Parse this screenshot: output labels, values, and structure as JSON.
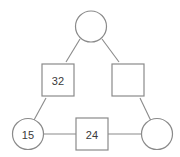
{
  "diagram": {
    "type": "pedigree-chart",
    "background_color": "#ffffff",
    "stroke_color": "#8a8a8a",
    "label_color": "#3a3a3a",
    "nodes": [
      {
        "id": "top-circle",
        "shape": "circle",
        "label": "",
        "cx": 91,
        "cy": 26.5,
        "r": 15.5
      },
      {
        "id": "left-square",
        "shape": "square",
        "label": "32",
        "x": 42,
        "y": 64,
        "size": 32
      },
      {
        "id": "right-square",
        "shape": "square",
        "label": "",
        "x": 112,
        "y": 64,
        "size": 32
      },
      {
        "id": "bottom-left-circle",
        "shape": "circle",
        "label": "15",
        "cx": 28,
        "cy": 134,
        "r": 15.5
      },
      {
        "id": "bottom-middle-square",
        "shape": "square",
        "label": "24",
        "x": 76,
        "y": 118,
        "size": 32
      },
      {
        "id": "bottom-right-circle",
        "shape": "circle",
        "label": "",
        "cx": 157,
        "cy": 134,
        "r": 15.5
      }
    ],
    "edges": [
      {
        "id": "edge-top-to-left-square",
        "x1": 80,
        "y1": 39,
        "x2": 66,
        "y2": 62
      },
      {
        "id": "edge-top-to-right-square",
        "x1": 102,
        "y1": 39,
        "x2": 119,
        "y2": 62
      },
      {
        "id": "edge-left-square-to-left-circle",
        "x1": 46,
        "y1": 98,
        "x2": 34,
        "y2": 120
      },
      {
        "id": "edge-right-square-to-right-circle",
        "x1": 140,
        "y1": 98,
        "x2": 151,
        "y2": 121
      },
      {
        "id": "edge-left-circle-to-middle-square",
        "x1": 43.5,
        "y1": 134,
        "x2": 76,
        "y2": 134
      },
      {
        "id": "edge-middle-square-to-right-circle",
        "x1": 108,
        "y1": 134,
        "x2": 141.5,
        "y2": 134
      }
    ]
  }
}
